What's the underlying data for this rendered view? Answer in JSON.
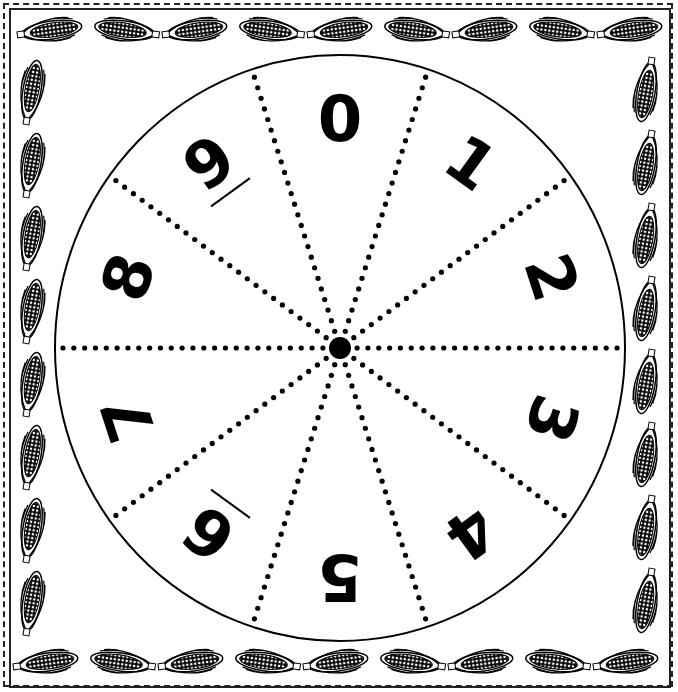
{
  "spinner": {
    "center": [
      340,
      348
    ],
    "radius_x": 285,
    "radius_y": 293,
    "sections": 10,
    "numbers": [
      "0",
      "1",
      "2",
      "3",
      "4",
      "5",
      "6",
      "7",
      "8",
      "9"
    ],
    "underline_marks": [
      "6",
      "9"
    ]
  },
  "border": {
    "style": "corn-cob-frame",
    "top_count": 9,
    "bottom_count": 9,
    "left_count": 8,
    "right_count": 8
  },
  "colors": {
    "ink": "#000000",
    "paper": "#ffffff"
  }
}
